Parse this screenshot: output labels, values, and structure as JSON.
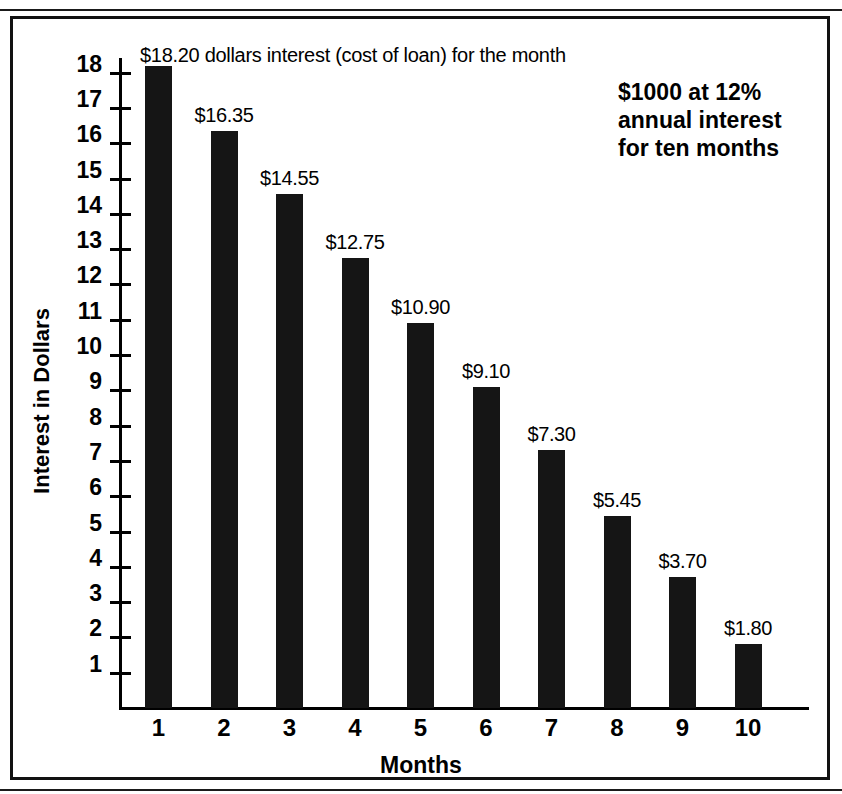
{
  "chart_data": {
    "type": "bar",
    "title": "",
    "xlabel": "Months",
    "ylabel": "Interest in Dollars",
    "categories": [
      "1",
      "2",
      "3",
      "4",
      "5",
      "6",
      "7",
      "8",
      "9",
      "10"
    ],
    "values": [
      18.2,
      16.35,
      14.55,
      12.75,
      10.9,
      9.1,
      7.3,
      5.45,
      3.7,
      1.8
    ],
    "value_labels": [
      "$18.20",
      "$16.35",
      "$14.55",
      "$12.75",
      "$10.90",
      "$9.10",
      "$7.30",
      "$5.45",
      "$3.70",
      "$1.80"
    ],
    "ylim": [
      0,
      18.6
    ],
    "y_ticks": [
      18,
      17,
      16,
      15,
      14,
      13,
      12,
      11,
      10,
      9,
      8,
      7,
      6,
      5,
      4,
      3,
      2,
      1
    ],
    "y_tick_labels": [
      "18",
      "17",
      "16",
      "15",
      "14",
      "13",
      "12",
      "11",
      "10",
      "9",
      "8",
      "7",
      "6",
      "5",
      "4",
      "3",
      "2",
      "1"
    ],
    "grid": false,
    "legend": null,
    "bar_color": "#151515",
    "axis_color": "#000000",
    "background_color": "#ffffff",
    "annotations": [
      {
        "name": "first-bar-description",
        "text": "$18.20 dollars interest (cost of loan) for the month"
      },
      {
        "name": "loan-terms-note",
        "text": "$1000 at 12%\nannual interest\nfor ten months"
      }
    ]
  },
  "axes": {
    "x_title": "Months",
    "y_title": "Interest in Dollars"
  },
  "annotations": {
    "top_description": "$18.20 dollars interest (cost of loan) for the month",
    "loan_terms": "$1000 at 12%\nannual interest\nfor ten months"
  }
}
